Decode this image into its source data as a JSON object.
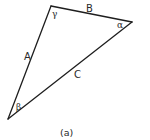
{
  "figure": {
    "caption": "(a)",
    "type": "triangle",
    "colors": {
      "stroke": "#1e1e1e",
      "text": "#2a2a2a",
      "background": "#ffffff"
    },
    "vertices": {
      "top": {
        "x": 51,
        "y": 6,
        "angle_label": "γ"
      },
      "right": {
        "x": 132,
        "y": 22,
        "angle_label": "α"
      },
      "bottom_left": {
        "x": 8,
        "y": 119,
        "angle_label": "β"
      }
    },
    "sides": {
      "top": {
        "label": "B"
      },
      "left": {
        "label": "A"
      },
      "hypotenuse": {
        "label": "C"
      }
    }
  }
}
